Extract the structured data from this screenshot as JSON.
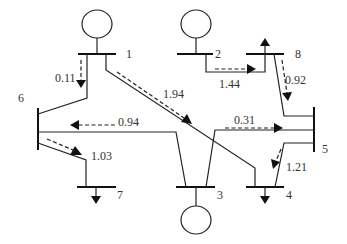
{
  "diagram": {
    "type": "power-system-one-line",
    "buses": [
      {
        "id": "1",
        "label": "1",
        "type": "generator"
      },
      {
        "id": "2",
        "label": "2",
        "type": "generator"
      },
      {
        "id": "3",
        "label": "3",
        "type": "generator"
      },
      {
        "id": "4",
        "label": "4",
        "type": "load"
      },
      {
        "id": "5",
        "label": "5",
        "type": "bus"
      },
      {
        "id": "6",
        "label": "6",
        "type": "bus"
      },
      {
        "id": "7",
        "label": "7",
        "type": "load"
      },
      {
        "id": "8",
        "label": "8",
        "type": "load"
      }
    ],
    "flows": [
      {
        "from": "1",
        "to": "6",
        "value": "0.11"
      },
      {
        "from": "1",
        "to": "4",
        "value": "1.94"
      },
      {
        "from": "2",
        "to": "8",
        "value": "1.44"
      },
      {
        "from": "8",
        "to": "5",
        "value": "0.92"
      },
      {
        "from": "3",
        "to": "6",
        "value": "0.94"
      },
      {
        "from": "3",
        "to": "5",
        "value": "0.31"
      },
      {
        "from": "6",
        "to": "7",
        "value": "1.03"
      },
      {
        "from": "5",
        "to": "4",
        "value": "1.21"
      }
    ]
  }
}
